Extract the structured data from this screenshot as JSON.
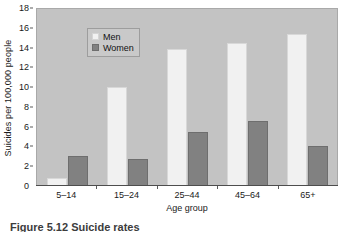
{
  "chart_data": {
    "type": "bar",
    "title": "",
    "xlabel": "Age group",
    "ylabel": "Suicides per 100,000 people",
    "categories": [
      "5–14",
      "15–24",
      "25–44",
      "45–64",
      "65+"
    ],
    "series": [
      {
        "name": "Men",
        "color": "#f1f1f1",
        "values": [
          0.7,
          9.9,
          13.8,
          14.4,
          15.3
        ]
      },
      {
        "name": "Women",
        "color": "#818181",
        "values": [
          2.9,
          2.6,
          5.4,
          6.5,
          3.9
        ]
      }
    ],
    "ylim": [
      0,
      18
    ],
    "yticks": [
      0,
      2,
      4,
      6,
      8,
      10,
      12,
      14,
      16,
      18
    ],
    "ytick_labels": [
      "0",
      "2",
      "4",
      "6",
      "8",
      "10",
      "12",
      "14",
      "16",
      "18"
    ],
    "grid": false,
    "legend_position": "upper left",
    "plot_background": "#c3c3c3",
    "figure_background": "#ffffff"
  },
  "legend": {
    "entries": [
      {
        "label": "Men"
      },
      {
        "label": "Women"
      }
    ]
  },
  "caption": {
    "text": "Figure 5.12 Suicide rates"
  }
}
